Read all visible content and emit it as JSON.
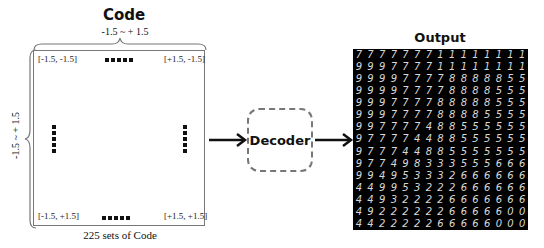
{
  "code_panel": {
    "title": "Code",
    "range_horizontal": "-1.5 ~ + 1.5",
    "range_vertical": "-1.5 ~ + 1.5",
    "corners": {
      "top_left": "[-1.5, -1.5]",
      "top_right": "[+1.5, -1.5]",
      "bottom_left": "[-1.5, +1.5]",
      "bottom_right": "[+1.5, +1.5]"
    },
    "caption": "225 sets of Code"
  },
  "decoder": {
    "label": "Decoder"
  },
  "output_panel": {
    "title": "Output",
    "grid_size": "15x15",
    "digits": [
      [
        "7",
        "7",
        "7",
        "7",
        "7",
        "7",
        "7",
        "1",
        "1",
        "1",
        "1",
        "1",
        "1",
        "1",
        "1"
      ],
      [
        "9",
        "9",
        "9",
        "7",
        "7",
        "7",
        "7",
        "1",
        "1",
        "1",
        "1",
        "1",
        "1",
        "1",
        "1"
      ],
      [
        "9",
        "9",
        "9",
        "9",
        "7",
        "7",
        "7",
        "7",
        "8",
        "8",
        "8",
        "8",
        "8",
        "5",
        "5"
      ],
      [
        "9",
        "9",
        "9",
        "9",
        "7",
        "7",
        "7",
        "7",
        "8",
        "8",
        "8",
        "8",
        "5",
        "5",
        "5"
      ],
      [
        "9",
        "9",
        "9",
        "7",
        "7",
        "7",
        "7",
        "8",
        "8",
        "8",
        "8",
        "8",
        "5",
        "5",
        "5"
      ],
      [
        "9",
        "9",
        "9",
        "7",
        "7",
        "7",
        "7",
        "8",
        "8",
        "8",
        "8",
        "5",
        "5",
        "5",
        "5"
      ],
      [
        "9",
        "9",
        "7",
        "7",
        "7",
        "7",
        "4",
        "8",
        "8",
        "5",
        "5",
        "5",
        "5",
        "5",
        "5"
      ],
      [
        "9",
        "7",
        "7",
        "7",
        "7",
        "4",
        "4",
        "8",
        "8",
        "5",
        "5",
        "5",
        "5",
        "5",
        "5"
      ],
      [
        "9",
        "7",
        "7",
        "7",
        "4",
        "4",
        "8",
        "8",
        "5",
        "5",
        "5",
        "5",
        "5",
        "5",
        "5"
      ],
      [
        "9",
        "7",
        "7",
        "4",
        "9",
        "8",
        "3",
        "3",
        "3",
        "5",
        "5",
        "5",
        "6",
        "6",
        "6"
      ],
      [
        "9",
        "9",
        "4",
        "9",
        "5",
        "3",
        "3",
        "3",
        "2",
        "6",
        "6",
        "6",
        "6",
        "6",
        "6"
      ],
      [
        "4",
        "4",
        "9",
        "9",
        "5",
        "3",
        "2",
        "2",
        "2",
        "6",
        "6",
        "6",
        "6",
        "6",
        "6"
      ],
      [
        "4",
        "4",
        "9",
        "3",
        "2",
        "2",
        "2",
        "2",
        "6",
        "6",
        "6",
        "6",
        "6",
        "6",
        "6"
      ],
      [
        "4",
        "9",
        "2",
        "2",
        "2",
        "2",
        "2",
        "2",
        "6",
        "6",
        "6",
        "6",
        "6",
        "0",
        "0"
      ],
      [
        "4",
        "4",
        "2",
        "2",
        "2",
        "2",
        "2",
        "6",
        "6",
        "6",
        "6",
        "6",
        "0",
        "0",
        "0"
      ]
    ]
  },
  "colors": {
    "grid_bg": "#000000",
    "digit": "#d8d8d8",
    "box_border": "#777777",
    "arrow": "#111111"
  }
}
